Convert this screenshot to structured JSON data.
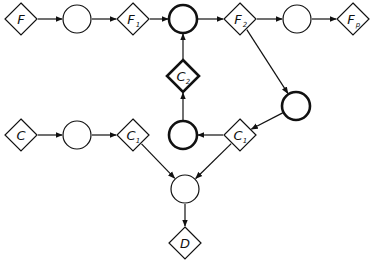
{
  "diagram": {
    "nodes": [
      {
        "id": "F",
        "shape": "diamond",
        "label": "F",
        "sub": "",
        "x": 21,
        "y": 19,
        "bold": false
      },
      {
        "id": "o1",
        "shape": "circle",
        "label": "",
        "sub": "",
        "x": 77,
        "y": 19,
        "bold": false
      },
      {
        "id": "F1",
        "shape": "diamond",
        "label": "F",
        "sub": "1",
        "x": 133,
        "y": 19,
        "bold": false
      },
      {
        "id": "o2",
        "shape": "circle",
        "label": "",
        "sub": "",
        "x": 183,
        "y": 19,
        "bold": true
      },
      {
        "id": "F2",
        "shape": "diamond",
        "label": "F",
        "sub": "2",
        "x": 240,
        "y": 19,
        "bold": false
      },
      {
        "id": "o3",
        "shape": "circle",
        "label": "",
        "sub": "",
        "x": 297,
        "y": 19,
        "bold": false
      },
      {
        "id": "Fp",
        "shape": "diamond",
        "label": "F",
        "sub": "p",
        "x": 353,
        "y": 19,
        "bold": false
      },
      {
        "id": "C2",
        "shape": "diamond",
        "label": "C",
        "sub": "2",
        "x": 183,
        "y": 76,
        "bold": true
      },
      {
        "id": "o4",
        "shape": "circle",
        "label": "",
        "sub": "",
        "x": 296,
        "y": 106,
        "bold": true
      },
      {
        "id": "C",
        "shape": "diamond",
        "label": "C",
        "sub": "",
        "x": 21,
        "y": 135,
        "bold": false
      },
      {
        "id": "o5",
        "shape": "circle",
        "label": "",
        "sub": "",
        "x": 77,
        "y": 135,
        "bold": false
      },
      {
        "id": "C1a",
        "shape": "diamond",
        "label": "C",
        "sub": "1",
        "x": 133,
        "y": 135,
        "bold": false
      },
      {
        "id": "o6",
        "shape": "circle",
        "label": "",
        "sub": "",
        "x": 183,
        "y": 135,
        "bold": true
      },
      {
        "id": "C1b",
        "shape": "diamond",
        "label": "C",
        "sub": "1",
        "x": 240,
        "y": 135,
        "bold": false
      },
      {
        "id": "o7",
        "shape": "circle",
        "label": "",
        "sub": "",
        "x": 185,
        "y": 189,
        "bold": false
      },
      {
        "id": "D",
        "shape": "diamond",
        "label": "D",
        "sub": "",
        "x": 185,
        "y": 243,
        "bold": false
      }
    ],
    "edges": [
      {
        "from": "F",
        "to": "o1"
      },
      {
        "from": "o1",
        "to": "F1"
      },
      {
        "from": "F1",
        "to": "o2"
      },
      {
        "from": "o2",
        "to": "F2"
      },
      {
        "from": "F2",
        "to": "o3"
      },
      {
        "from": "o3",
        "to": "Fp"
      },
      {
        "from": "F2",
        "to": "o4"
      },
      {
        "from": "o4",
        "to": "C1b"
      },
      {
        "from": "C1b",
        "to": "o6"
      },
      {
        "from": "o6",
        "to": "C2"
      },
      {
        "from": "C2",
        "to": "o2"
      },
      {
        "from": "C",
        "to": "o5"
      },
      {
        "from": "o5",
        "to": "C1a"
      },
      {
        "from": "C1a",
        "to": "o7"
      },
      {
        "from": "C1b",
        "to": "o7"
      },
      {
        "from": "o7",
        "to": "D"
      }
    ]
  }
}
